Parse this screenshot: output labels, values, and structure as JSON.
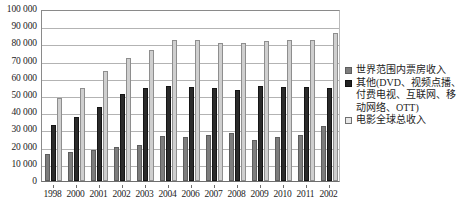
{
  "chart_data": {
    "type": "bar",
    "title": "",
    "xlabel": "",
    "ylabel": "",
    "ylim": [
      0,
      100000
    ],
    "ytick_step": 10000,
    "grid": true,
    "legend_position": "right",
    "categories": [
      "1998",
      "2000",
      "2001",
      "2002",
      "2003",
      "2004",
      "2006",
      "2007",
      "2008",
      "2009",
      "2010",
      "2011",
      "2002"
    ],
    "ytick_labels": [
      "100 000",
      "90 000",
      "80 000",
      "70 000",
      "60 000",
      "50 000",
      "40 000",
      "30 000",
      "20 000",
      "10 000",
      "0"
    ],
    "ytick_values": [
      100000,
      90000,
      80000,
      70000,
      60000,
      50000,
      40000,
      30000,
      20000,
      10000,
      0
    ],
    "series": [
      {
        "name": "世界范围内票房收入",
        "color": "#7d7d7d",
        "values": [
          15500,
          17000,
          18000,
          19500,
          20800,
          26000,
          25500,
          26500,
          28000,
          24000,
          25500,
          27000,
          32000
        ]
      },
      {
        "name": "其他(DVD、视频点播、付费电视、互联网、移动网络、OTT)",
        "color": "#2b2b2b",
        "values": [
          32500,
          37000,
          43000,
          50500,
          54000,
          55000,
          54500,
          54000,
          53000,
          55500,
          54500,
          54500,
          54000
        ]
      },
      {
        "name": "电影全球总收入",
        "color": "#cfcfcf",
        "values": [
          48000,
          54000,
          64000,
          71500,
          76000,
          82000,
          82000,
          80000,
          80000,
          81500,
          82000,
          82000,
          86000
        ]
      }
    ]
  },
  "legend": {
    "entries": [
      {
        "label": "世界范围内票房收入"
      },
      {
        "label": "其他(DVD、视频点播、付费电视、移动网络、OTT)"
      },
      {
        "label": "电影全球总收入"
      }
    ],
    "entry_0_label": "世界范围内票房收入",
    "entry_1_label": "其他(DVD、视频点播、付费电视、互联网、移动网络、OTT)",
    "entry_2_label": "电影全球总收入"
  }
}
